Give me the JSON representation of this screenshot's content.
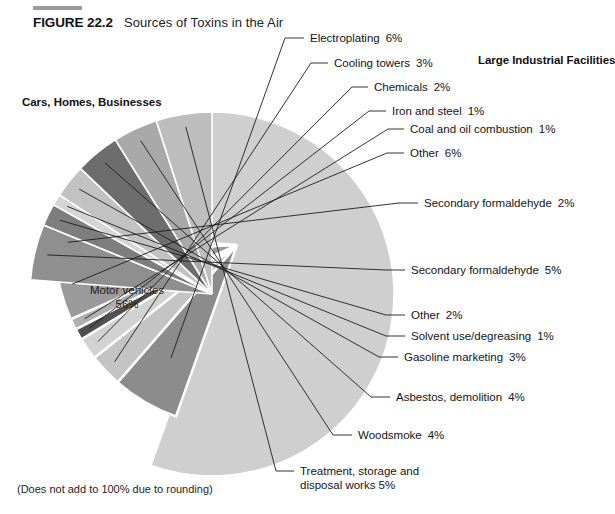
{
  "figure": {
    "number": "FIGURE 22.2",
    "title": "Sources of Toxins in the Air",
    "footnote": "(Does not add to 100% due to rounding)"
  },
  "groups": {
    "left_heading": "Cars, Homes, Businesses",
    "right_heading": "Large Industrial Facilities"
  },
  "center": {
    "label": "Motor vehicles",
    "value": "56%"
  },
  "callouts": [
    {
      "label": "Electroplating",
      "value": "6%"
    },
    {
      "label": "Cooling towers",
      "value": "3%"
    },
    {
      "label": "Chemicals",
      "value": "2%"
    },
    {
      "label": "Iron and steel",
      "value": "1%"
    },
    {
      "label": "Coal and oil combustion",
      "value": "1%"
    },
    {
      "label": "Other",
      "value": "6%"
    },
    {
      "label": "Secondary formaldehyde",
      "value": "2%"
    },
    {
      "label": "Secondary formaldehyde",
      "value": "5%"
    },
    {
      "label": "Other",
      "value": "2%"
    },
    {
      "label": "Solvent use/degreasing",
      "value": "1%"
    },
    {
      "label": "Gasoline marketing",
      "value": "3%"
    },
    {
      "label": "Asbestos, demolition",
      "value": "4%"
    },
    {
      "label": "Woodsmoke",
      "value": "4%"
    },
    {
      "label": "Treatment, storage and",
      "value": ""
    },
    {
      "label": "disposal works",
      "value": "5%"
    }
  ],
  "chart_data": {
    "type": "pie",
    "title": "Sources of Toxins in the Air",
    "subtitle": "",
    "note": "(Does not add to 100% due to rounding)",
    "units": "percent of total air toxins",
    "total_labeled": 101,
    "legend_position": "callout-labels",
    "grid": false,
    "categories": [
      "Motor vehicles",
      "Electroplating",
      "Cooling towers",
      "Chemicals",
      "Iron and steel",
      "Coal and oil combustion",
      "Other (industrial)",
      "Secondary formaldehyde (industrial)",
      "Secondary formaldehyde (area)",
      "Other (area)",
      "Solvent use/degreasing",
      "Gasoline marketing",
      "Asbestos, demolition",
      "Woodsmoke",
      "Treatment, storage and disposal works"
    ],
    "values": [
      56,
      6,
      3,
      2,
      1,
      1,
      6,
      2,
      5,
      2,
      1,
      3,
      4,
      4,
      5
    ],
    "group_of": [
      "Cars, Homes, Businesses",
      "Large Industrial Facilities",
      "Large Industrial Facilities",
      "Large Industrial Facilities",
      "Large Industrial Facilities",
      "Large Industrial Facilities",
      "Large Industrial Facilities",
      "Large Industrial Facilities",
      "Cars, Homes, Businesses",
      "Cars, Homes, Businesses",
      "Cars, Homes, Businesses",
      "Cars, Homes, Businesses",
      "Cars, Homes, Businesses",
      "Cars, Homes, Businesses",
      "Cars, Homes, Businesses"
    ],
    "slice_colors": [
      "#cfcfcf",
      "#8c8c8c",
      "#c4c4c4",
      "#d2d2d2",
      "#4f4f4f",
      "#b0b0b0",
      "#9a9a9a",
      "#c9c9c9",
      "#8f8f8f",
      "#7e7e7e",
      "#d5d5d5",
      "#c2c2c2",
      "#6d6d6d",
      "#a9a9a9",
      "#bdbdbd"
    ],
    "exploded_group": "Large Industrial Facilities"
  },
  "geometry": {
    "cx": 212,
    "cy": 294,
    "r": 182,
    "explode_cx": 237,
    "explode_cy": 245,
    "start_angle_deg": -90
  }
}
